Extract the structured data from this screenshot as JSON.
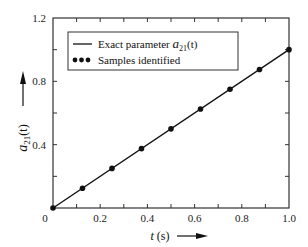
{
  "chart_data": {
    "type": "line",
    "title": "",
    "xlabel": "t (s)",
    "ylabel": "a21(t)",
    "xlim": [
      0,
      1.0
    ],
    "ylim": [
      0,
      1.2
    ],
    "x_ticks": [
      0,
      0.2,
      0.4,
      0.6,
      0.8,
      1.0
    ],
    "x_tick_labels": [
      "0",
      "0.2",
      "0.4",
      "0.6",
      "0.8",
      "1.0"
    ],
    "y_ticks": [
      0.4,
      0.8,
      1.2
    ],
    "y_tick_labels": [
      "0.4",
      "0.8",
      "1.2"
    ],
    "grid": false,
    "legend_position": "upper-left",
    "series": [
      {
        "name": "Exact parameter a21(t)",
        "style": "line",
        "x": [
          0,
          1.0
        ],
        "y": [
          0,
          1.0
        ]
      },
      {
        "name": "Samples identified",
        "style": "markers",
        "x": [
          0,
          0.125,
          0.25,
          0.375,
          0.5,
          0.625,
          0.75,
          0.875,
          1.0
        ],
        "y": [
          0,
          0.125,
          0.25,
          0.375,
          0.5,
          0.625,
          0.75,
          0.875,
          1.0
        ]
      }
    ]
  },
  "legend": {
    "line_label_prefix": "Exact parameter ",
    "line_label_var": "a",
    "line_label_sub": "21",
    "line_label_suffix": "(t)",
    "markers_label": "Samples identified"
  },
  "axes": {
    "x_title_var": "t",
    "x_title_unit": " (s)",
    "y_title_var": "a",
    "y_title_sub": "21",
    "y_title_suffix": "(t)",
    "origin_label": "0"
  },
  "colors": {
    "line": "#111111",
    "marker": "#111111",
    "axis": "#333333"
  }
}
